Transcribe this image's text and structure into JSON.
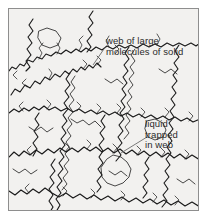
{
  "figure": {
    "type": "diagram",
    "background_color": "#f2f1ef",
    "border_color": "#8e8e8e",
    "strand_color": "#1a1a1a",
    "label_color": "#2b2b2b",
    "leader_color": "#6b6b6b"
  },
  "labels": {
    "web": {
      "line1": "web of large",
      "line2": "molecules of solid"
    },
    "liquid": {
      "line1": "liquid",
      "line2": "trapped",
      "line3": "in web"
    }
  }
}
